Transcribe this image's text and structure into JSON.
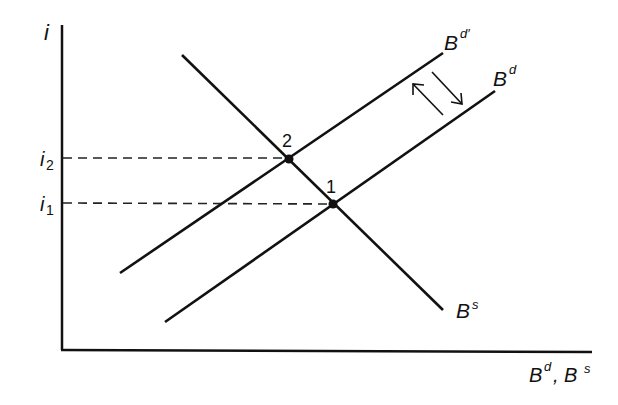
{
  "diagram": {
    "title": "",
    "axes": {
      "y_label": "i",
      "x_label_main": "B",
      "x_label_sup1": "d",
      "x_label_sep": ", B",
      "x_label_sup2": "s"
    },
    "y_ticks": [
      {
        "base": "i",
        "sub": "2"
      },
      {
        "base": "i",
        "sub": "1"
      }
    ],
    "curves": {
      "demand_new": {
        "base": "B",
        "sup": "d′"
      },
      "demand": {
        "base": "B",
        "sup": "d"
      },
      "supply": {
        "base": "B",
        "sup": "s"
      }
    },
    "points": [
      {
        "label": "2"
      },
      {
        "label": "1"
      }
    ],
    "colors": {
      "ink": "#111111",
      "background": "#ffffff"
    }
  }
}
